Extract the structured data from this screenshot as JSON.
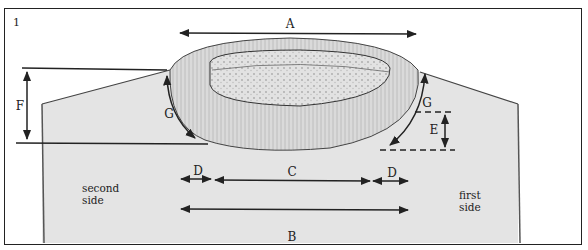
{
  "figure": {
    "number": "1",
    "labels": {
      "A": "A",
      "B": "B",
      "C": "C",
      "D_left": "D",
      "D_right": "D",
      "E": "E",
      "F": "F",
      "G_left": "G",
      "G_right": "G"
    },
    "sides": {
      "second": [
        "second",
        "side"
      ],
      "first": [
        "first",
        "side"
      ]
    },
    "colors": {
      "plate": "#e4e4e4",
      "ink": "#222222",
      "bead": "#d8d8d8"
    }
  }
}
